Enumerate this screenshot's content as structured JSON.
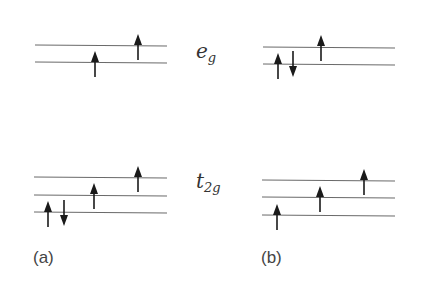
{
  "diagram": {
    "labels": {
      "eg": {
        "main": "e",
        "sub": "g"
      },
      "t2g": {
        "main": "t",
        "sub": "2g"
      }
    },
    "panels": [
      {
        "id": "a",
        "label": "(a)",
        "eg_levels": 2,
        "eg_electrons": [
          {
            "level": 1,
            "spin": "up"
          },
          {
            "level": 2,
            "spin": "up"
          }
        ],
        "t2g_levels": 3,
        "t2g_electrons": [
          {
            "level": 1,
            "spin": "up"
          },
          {
            "level": 1,
            "spin": "down"
          },
          {
            "level": 2,
            "spin": "up"
          },
          {
            "level": 3,
            "spin": "up"
          }
        ]
      },
      {
        "id": "b",
        "label": "(b)",
        "eg_levels": 2,
        "eg_electrons": [
          {
            "level": 1,
            "spin": "up"
          },
          {
            "level": 1,
            "spin": "down"
          },
          {
            "level": 2,
            "spin": "up"
          }
        ],
        "t2g_levels": 3,
        "t2g_electrons": [
          {
            "level": 1,
            "spin": "up"
          },
          {
            "level": 2,
            "spin": "up"
          },
          {
            "level": 3,
            "spin": "up"
          }
        ]
      }
    ]
  }
}
